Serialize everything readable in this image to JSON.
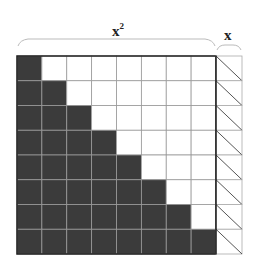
{
  "diagram": {
    "label_top": "x",
    "label_top_exponent": "2",
    "label_side": "x",
    "grid": {
      "rows": 8,
      "cols": 8,
      "filled_color": "#3b3b3b",
      "empty_color": "#ffffff",
      "line_color": "#9a9a9a",
      "border_color": "#222222",
      "description": "Staircase: row i (0-based) has i+1 filled cells from the left"
    },
    "side_column": {
      "rows": 8,
      "pattern": "diagonal-hatch"
    }
  }
}
